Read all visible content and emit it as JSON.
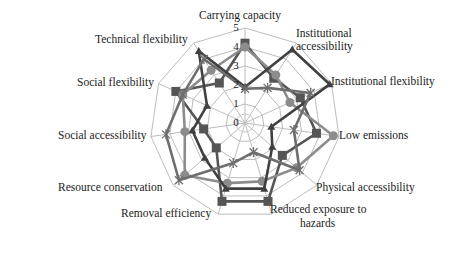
{
  "chart_data": {
    "type": "radar",
    "title": "",
    "categories": [
      "Carrying capacity",
      "Institutional accessibility",
      "Institutional flexibility",
      "Low emissions",
      "Physical accessibility",
      "Reduced exposure to hazards",
      "Removal efficiency",
      "Resource conservation",
      "Social accessibility",
      "Social flexibility",
      "Technical flexibility"
    ],
    "radial_ticks": [
      "0",
      "1",
      "2",
      "3",
      "4",
      "5"
    ],
    "rlim": [
      0,
      5
    ],
    "grid": true,
    "legend": null,
    "series": [
      {
        "name": "Series 1",
        "marker": "square",
        "color": "#555555",
        "values": [
          4.2,
          2.8,
          3.2,
          3.8,
          2.6,
          4.3,
          4.3,
          2.0,
          2.2,
          4.0,
          2.5
        ]
      },
      {
        "name": "Series 2",
        "marker": "circle",
        "color": "#8c8c8c",
        "values": [
          4.0,
          3.0,
          2.6,
          4.7,
          3.6,
          3.2,
          3.3,
          4.2,
          3.2,
          3.6,
          3.3
        ]
      },
      {
        "name": "Series 3",
        "marker": "triangle",
        "color": "#404040",
        "values": [
          1.9,
          4.6,
          4.9,
          1.4,
          1.9,
          3.6,
          3.6,
          2.8,
          2.8,
          2.2,
          4.5
        ]
      },
      {
        "name": "Series 4",
        "marker": "star",
        "color": "#6e6e6e",
        "values": [
          1.8,
          2.2,
          3.8,
          2.6,
          3.8,
          1.6,
          2.2,
          4.6,
          4.2,
          3.6,
          4.0
        ]
      }
    ]
  },
  "labels": {
    "carrying_capacity": "Carrying capacity",
    "institutional_accessibility_1": "Institutional",
    "institutional_accessibility_2": "accessibility",
    "institutional_flexibility": "Institutional flexibility",
    "low_emissions": "Low emissions",
    "physical_accessibility": "Physical accessibility",
    "reduced_exposure_1": "Reduced exposure to",
    "reduced_exposure_2": "hazards",
    "removal_efficiency": "Removal efficiency",
    "resource_conservation": "Resource conservation",
    "social_accessibility": "Social accessibility",
    "social_flexibility": "Social flexibility",
    "technical_flexibility": "Technical flexibility"
  }
}
